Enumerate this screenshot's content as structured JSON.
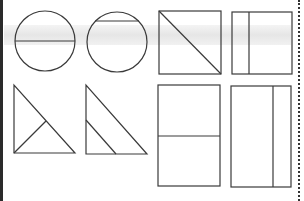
{
  "worksheet": {
    "description": "Geometric shapes divided into parts",
    "colors": {
      "stroke": "#3a3a3a",
      "background": "#ffffff",
      "band": "#e8e8e8",
      "left_edge": "#2a2a2a"
    },
    "shapes": [
      {
        "id": "circle-diameter",
        "type": "circle",
        "division": "horizontal diameter"
      },
      {
        "id": "circle-chord",
        "type": "circle",
        "division": "horizontal chord near top"
      },
      {
        "id": "square-diagonal",
        "type": "square",
        "division": "diagonal"
      },
      {
        "id": "rectangle-vertical-left",
        "type": "rectangle",
        "division": "vertical line near left"
      },
      {
        "id": "triangle-median",
        "type": "right-triangle",
        "division": "line from right-angle vertex to hypotenuse"
      },
      {
        "id": "triangle-parallel",
        "type": "right-triangle",
        "division": "line parallel to hypotenuse"
      },
      {
        "id": "rectangle-horizontal-half",
        "type": "rectangle",
        "division": "horizontal middle line"
      },
      {
        "id": "rectangle-vertical-right",
        "type": "rectangle",
        "division": "vertical line near right"
      }
    ]
  }
}
